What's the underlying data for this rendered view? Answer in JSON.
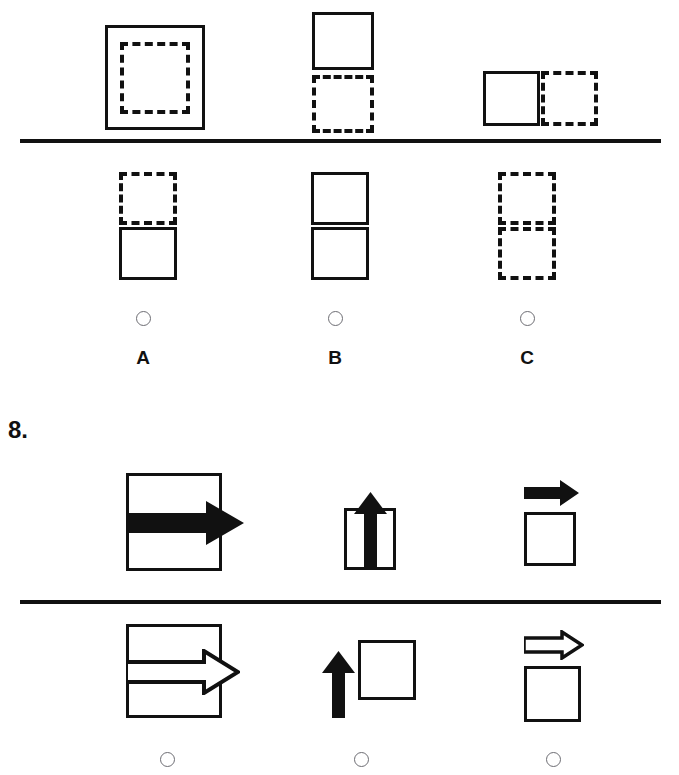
{
  "document": {
    "type": "visual-analogy-test",
    "background_color": "#ffffff",
    "ink_color": "#111111",
    "radio_border_color": "#6d6d73"
  },
  "question_7": {
    "prompt_row": {
      "name": "question-7-prompt-row",
      "items": [
        {
          "id": "q7-prompt-1",
          "description": "dashed square nested inside a large solid square",
          "shapes": [
            "solid-square",
            "dashed-square-inside"
          ]
        },
        {
          "id": "q7-prompt-2",
          "description": "solid square above a dashed square",
          "shapes": [
            "solid-square",
            "dashed-square-below"
          ]
        },
        {
          "id": "q7-prompt-3",
          "description": "solid square beside a dashed square on the right",
          "shapes": [
            "solid-square",
            "dashed-square-right"
          ]
        }
      ]
    },
    "answer_row": {
      "name": "question-7-answer-row",
      "options": [
        {
          "letter": "A",
          "id": "q7-option-a",
          "description": "dashed square above a solid square",
          "selected": false
        },
        {
          "letter": "B",
          "id": "q7-option-b",
          "description": "solid square above a solid square",
          "selected": false
        },
        {
          "letter": "C",
          "id": "q7-option-c",
          "description": "dashed square above a dashed square",
          "selected": false
        }
      ]
    }
  },
  "question_8": {
    "number_label": "8.",
    "prompt_row": {
      "name": "question-8-prompt-row",
      "items": [
        {
          "id": "q8-prompt-1",
          "description": "large square containing a large filled right arrow breaking the right edge",
          "arrow_style": "filled",
          "arrow_direction": "right"
        },
        {
          "id": "q8-prompt-2",
          "description": "small square containing a filled up arrow breaking the top edge",
          "arrow_style": "filled",
          "arrow_direction": "up"
        },
        {
          "id": "q8-prompt-3",
          "description": "filled right arrow above a separate empty square",
          "arrow_style": "filled",
          "arrow_direction": "right"
        }
      ]
    },
    "answer_row": {
      "name": "question-8-answer-row",
      "options": [
        {
          "letter": "",
          "id": "q8-option-a",
          "description": "large square containing a hollow outlined right arrow breaking the right edge",
          "arrow_style": "outline",
          "arrow_direction": "right",
          "selected": false
        },
        {
          "letter": "",
          "id": "q8-option-b",
          "description": "filled up arrow to the left of an empty square",
          "arrow_style": "filled",
          "arrow_direction": "up",
          "selected": false
        },
        {
          "letter": "",
          "id": "q8-option-c",
          "description": "hollow outlined right arrow above a separate empty square",
          "arrow_style": "outline",
          "arrow_direction": "right",
          "selected": false
        }
      ]
    }
  }
}
